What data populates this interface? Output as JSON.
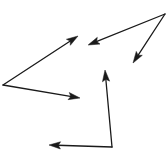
{
  "figure": {
    "background_color": "#ffffff",
    "stroke_color": "#1a1a1a",
    "stroke_width": 1.3,
    "width": 167,
    "height": 164,
    "arrowhead_style": "solid-triangle"
  },
  "shapes": [
    {
      "name": "left-angle-figure",
      "description": "Acute angle opening rightward, vertex at left edge, two rays with arrowheads pointing right",
      "vertex": {
        "x": 3,
        "y": 85
      },
      "rays": [
        {
          "name": "upper-right-ray",
          "from": {
            "x": 3,
            "y": 85
          },
          "to": {
            "x": 78,
            "y": 36
          },
          "arrow_at": "to",
          "direction": "up-right"
        },
        {
          "name": "lower-right-ray",
          "from": {
            "x": 3,
            "y": 85
          },
          "to": {
            "x": 80,
            "y": 98
          },
          "arrow_at": "to",
          "direction": "right-slightly-down"
        }
      ]
    },
    {
      "name": "right-angle-figure",
      "description": "Narrow acute angle, vertex at top-right corner, two rays with arrowheads pointing down-left",
      "vertex": {
        "x": 165,
        "y": 14
      },
      "rays": [
        {
          "name": "left-ray",
          "from": {
            "x": 165,
            "y": 14
          },
          "to": {
            "x": 88,
            "y": 45
          },
          "arrow_at": "to",
          "direction": "left-down"
        },
        {
          "name": "down-ray",
          "from": {
            "x": 165,
            "y": 14
          },
          "to": {
            "x": 133,
            "y": 63
          },
          "arrow_at": "to",
          "direction": "down-left"
        }
      ]
    },
    {
      "name": "bottom-angle-figure",
      "description": "Right-ish angle, vertex at bottom, one ray pointing up and one ray pointing left",
      "vertex": {
        "x": 112,
        "y": 147
      },
      "rays": [
        {
          "name": "up-ray",
          "from": {
            "x": 112,
            "y": 147
          },
          "to": {
            "x": 105,
            "y": 70
          },
          "arrow_at": "to",
          "direction": "up"
        },
        {
          "name": "left-ray",
          "from": {
            "x": 112,
            "y": 147
          },
          "to": {
            "x": 49,
            "y": 145
          },
          "arrow_at": "to",
          "direction": "left"
        }
      ]
    }
  ]
}
